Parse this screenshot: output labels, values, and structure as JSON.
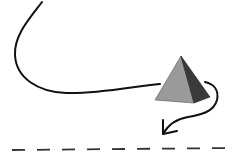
{
  "diagram": {
    "colors": {
      "background": "#ffffff",
      "stroke": "#111111",
      "pyramid_front": "#9a9a9a",
      "pyramid_side": "#3a3a3a",
      "dash": "#333333"
    },
    "elements": [
      {
        "name": "curved-path-arrow",
        "type": "arrow"
      },
      {
        "name": "pyramid",
        "type": "shape"
      },
      {
        "name": "dashed-line",
        "type": "line"
      }
    ]
  }
}
